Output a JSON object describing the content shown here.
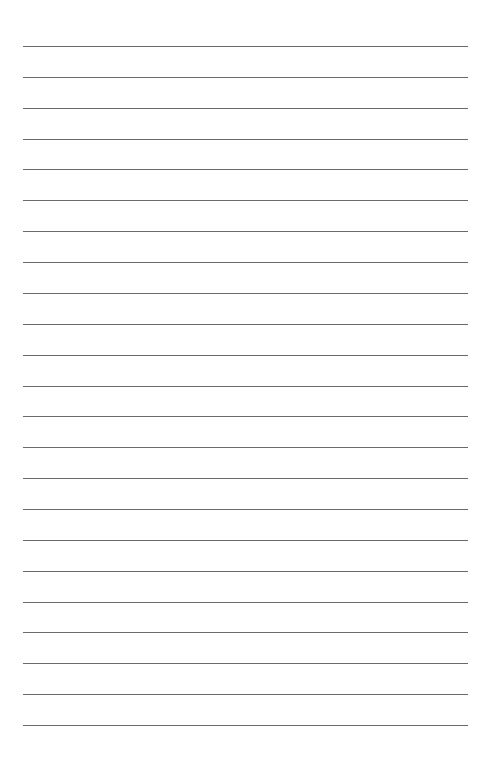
{
  "page": {
    "type": "lined-paper",
    "line_count": 23,
    "first_line_y": 46,
    "last_line_y": 725,
    "line_left": 23,
    "line_right": 468,
    "line_color": "#6a6a6a",
    "background": "#ffffff"
  }
}
